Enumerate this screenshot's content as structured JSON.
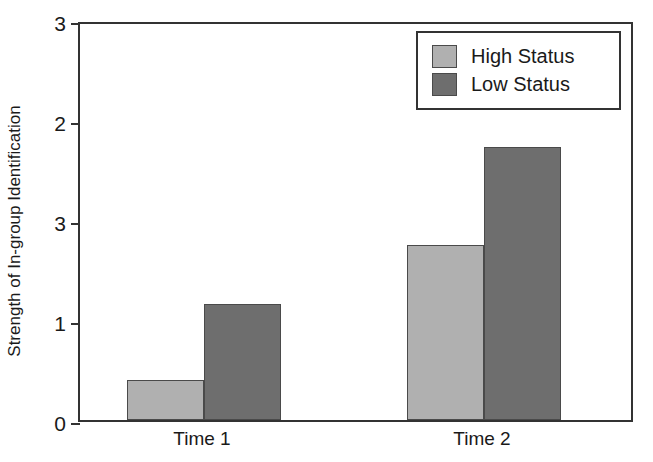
{
  "chart_data": {
    "type": "bar",
    "title": "",
    "xlabel": "",
    "ylabel": "Strength of In-group Identification",
    "categories": [
      "Time 1",
      "Time 2"
    ],
    "series": [
      {
        "name": "High Status",
        "color": "#b0b0b0",
        "values": [
          0.3,
          1.31
        ]
      },
      {
        "name": "Low Status",
        "color": "#6e6e6e",
        "values": [
          0.87,
          2.05
        ]
      }
    ],
    "ylim": [
      0,
      3
    ],
    "ytick_labels": [
      "3",
      "2",
      "3",
      "1",
      "0"
    ],
    "ytick_values": [
      3,
      2.25,
      1.5,
      0.75,
      0
    ],
    "grid": false,
    "legend_position": "top-right",
    "legend_entries": [
      "High Status",
      "Low Status"
    ]
  },
  "axis": {
    "y_title": "Strength of In-group Identification"
  },
  "legend": {
    "items": [
      {
        "label": "High Status"
      },
      {
        "label": "Low Status"
      }
    ]
  },
  "x_axis": {
    "categories": [
      {
        "label": "Time 1"
      },
      {
        "label": "Time 2"
      }
    ]
  },
  "y_axis": {
    "ticks": [
      {
        "label": "3"
      },
      {
        "label": "2"
      },
      {
        "label": "3"
      },
      {
        "label": "1"
      },
      {
        "label": "0"
      }
    ]
  }
}
